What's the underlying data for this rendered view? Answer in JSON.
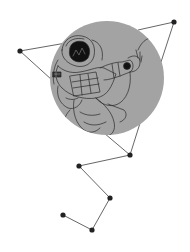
{
  "illustration": {
    "subject": "astronaut-in-circle-with-constellation",
    "colors": {
      "background": "#ffffff",
      "circle_fill": "#a3a3a3",
      "line": "#555555",
      "node": "#222222",
      "sketch": "#2a2a2a",
      "visor": "#111111"
    },
    "circle": {
      "cx": 107,
      "cy": 78,
      "r": 57
    },
    "nodes": [
      {
        "id": "n1",
        "x": 20,
        "y": 51
      },
      {
        "id": "n2",
        "x": 174,
        "y": 22
      },
      {
        "id": "n3",
        "x": 130,
        "y": 155
      },
      {
        "id": "n4",
        "x": 79,
        "y": 166
      },
      {
        "id": "n5",
        "x": 110,
        "y": 198
      },
      {
        "id": "n6",
        "x": 63,
        "y": 215
      },
      {
        "id": "n7",
        "x": 92,
        "y": 230
      }
    ]
  }
}
